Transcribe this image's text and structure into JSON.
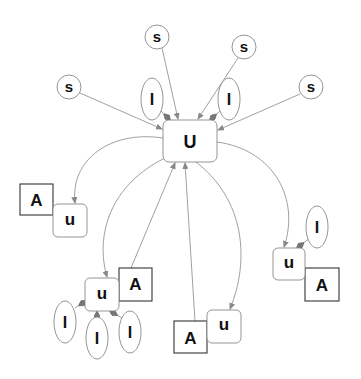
{
  "diagram": {
    "title": "",
    "central_node": {
      "id": "U",
      "label": "U",
      "shape": "rounded-rect",
      "x": 163,
      "y": 120,
      "w": 54,
      "h": 42
    },
    "s_nodes": [
      {
        "id": "s1",
        "label": "s",
        "cx": 157,
        "cy": 37,
        "r": 12
      },
      {
        "id": "s2",
        "label": "s",
        "cx": 244,
        "cy": 47,
        "r": 12
      },
      {
        "id": "s3",
        "label": "s",
        "cx": 69,
        "cy": 87,
        "r": 12
      },
      {
        "id": "s4",
        "label": "s",
        "cx": 311,
        "cy": 87,
        "r": 12
      }
    ],
    "i_nodes": [
      {
        "id": "i1",
        "label": "I",
        "cx": 152,
        "cy": 99,
        "rx": 11,
        "ry": 21,
        "attached_to": "U"
      },
      {
        "id": "i2",
        "label": "I",
        "cx": 229,
        "cy": 99,
        "rx": 11,
        "ry": 21,
        "attached_to": "U"
      },
      {
        "id": "i3",
        "label": "I",
        "cx": 65,
        "cy": 322,
        "rx": 11,
        "ry": 21,
        "attached_to": "u2"
      },
      {
        "id": "i4",
        "label": "I",
        "cx": 97,
        "cy": 338,
        "rx": 11,
        "ry": 21,
        "attached_to": "u2"
      },
      {
        "id": "i5",
        "label": "I",
        "cx": 130,
        "cy": 332,
        "rx": 11,
        "ry": 21,
        "attached_to": "u2"
      },
      {
        "id": "i6",
        "label": "I",
        "cx": 317,
        "cy": 227,
        "rx": 11,
        "ry": 21,
        "attached_to": "u4"
      }
    ],
    "u_nodes": [
      {
        "id": "u1",
        "label": "u",
        "x": 53,
        "y": 204,
        "w": 34,
        "h": 33
      },
      {
        "id": "u2",
        "label": "u",
        "x": 85,
        "y": 278,
        "w": 34,
        "h": 33
      },
      {
        "id": "u3",
        "label": "u",
        "x": 207,
        "y": 310,
        "w": 34,
        "h": 33
      },
      {
        "id": "u4",
        "label": "u",
        "x": 273,
        "y": 248,
        "w": 32,
        "h": 32
      }
    ],
    "a_nodes": [
      {
        "id": "a1",
        "label": "A",
        "x": 20,
        "y": 184,
        "w": 33,
        "h": 31
      },
      {
        "id": "a2",
        "label": "A",
        "x": 119,
        "y": 268,
        "w": 33,
        "h": 33
      },
      {
        "id": "a3",
        "label": "A",
        "x": 174,
        "y": 321,
        "w": 33,
        "h": 32
      },
      {
        "id": "a4",
        "label": "A",
        "x": 305,
        "y": 268,
        "w": 34,
        "h": 33
      }
    ],
    "edges": [
      {
        "from": "s1",
        "to": "U"
      },
      {
        "from": "s2",
        "to": "U"
      },
      {
        "from": "s3",
        "to": "U"
      },
      {
        "from": "s4",
        "to": "U"
      },
      {
        "from": "U",
        "to": "u1"
      },
      {
        "from": "U",
        "to": "u2"
      },
      {
        "from": "U",
        "to": "u3"
      },
      {
        "from": "U",
        "to": "u4"
      },
      {
        "from": "a2",
        "to": "U"
      },
      {
        "from": "a3",
        "to": "U"
      }
    ]
  }
}
